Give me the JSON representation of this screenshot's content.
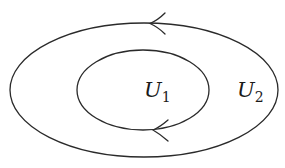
{
  "diagram": {
    "type": "nested-regions",
    "stroke_color": "#2a2a2a",
    "background": "#ffffff",
    "regions": [
      {
        "id": "outer",
        "label_main": "U",
        "label_sub": "2",
        "orientation": "counterclockwise-arrow-left-at-top"
      },
      {
        "id": "inner",
        "label_main": "U",
        "label_sub": "1",
        "orientation": "arrow-left-at-bottom"
      }
    ],
    "labels": {
      "u1_main": "U",
      "u1_sub": "1",
      "u2_main": "U",
      "u2_sub": "2"
    }
  }
}
